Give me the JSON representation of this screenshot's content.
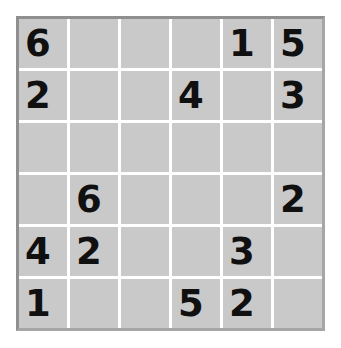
{
  "puzzle": {
    "title": "Sudoku 6x6 Puzzle Grid",
    "size": 6,
    "box_rows": 2,
    "box_cols": 3,
    "colors": {
      "page_background": "#ffffff",
      "cell_background": "#c9c9c9",
      "grid_line": "#ffffff",
      "outer_border_top_left": "#8f8f8f",
      "outer_border_bottom_right": "#a6a6a6",
      "digit": "#101010"
    },
    "rows": [
      {
        "label": "row-1",
        "cells": [
          "6",
          "",
          "",
          "",
          "1",
          "5"
        ]
      },
      {
        "label": "row-2",
        "cells": [
          "2",
          "",
          "",
          "4",
          "",
          "3"
        ]
      },
      {
        "label": "row-3",
        "cells": [
          "",
          "",
          "",
          "",
          "",
          ""
        ]
      },
      {
        "label": "row-4",
        "cells": [
          "",
          "6",
          "",
          "",
          "",
          "2"
        ]
      },
      {
        "label": "row-5",
        "cells": [
          "4",
          "2",
          "",
          "",
          "3",
          ""
        ]
      },
      {
        "label": "row-6",
        "cells": [
          "1",
          "",
          "",
          "5",
          "2",
          ""
        ]
      }
    ]
  }
}
